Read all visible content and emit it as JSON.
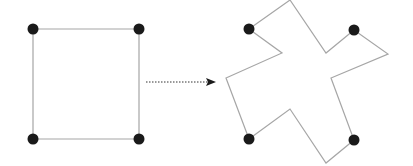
{
  "diagram": {
    "colors": {
      "edge": "#a6a6a6",
      "point": "#1a1a1a",
      "arrow": "#333333",
      "background": "#ffffff"
    },
    "source_shape": {
      "label": "square",
      "points": [
        [
          33,
          29
        ],
        [
          139,
          29
        ],
        [
          139,
          139
        ],
        [
          33,
          139
        ]
      ]
    },
    "arrow": {
      "style": "dotted",
      "from": [
        146,
        82
      ],
      "to": [
        216,
        82
      ]
    },
    "target_shape": {
      "label": "warped-cross",
      "polygon": [
        [
          249,
          29
        ],
        [
          290,
          0
        ],
        [
          326,
          53
        ],
        [
          354,
          30
        ],
        [
          388,
          54
        ],
        [
          331,
          78
        ],
        [
          354,
          140
        ],
        [
          326,
          163
        ],
        [
          290,
          109
        ],
        [
          249,
          139
        ],
        [
          226,
          78
        ],
        [
          282,
          53
        ]
      ],
      "control_points": [
        [
          249,
          29
        ],
        [
          354,
          30
        ],
        [
          354,
          140
        ],
        [
          249,
          139
        ]
      ]
    }
  }
}
